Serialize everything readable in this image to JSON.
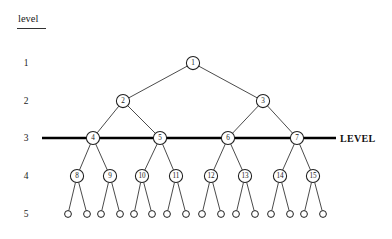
{
  "figure": {
    "header_label": "level",
    "level_line_label": "LEVEL",
    "level_numbers": [
      "1",
      "2",
      "3",
      "4",
      "5"
    ],
    "highlighted_level": "3"
  },
  "colors": {
    "background": "#ffffff",
    "edge": "#2b2b2b",
    "node_stroke": "#1f1f1f",
    "node_fill": "#ffffff",
    "thick_line": "#000000",
    "text": "#1a1a1a"
  },
  "chart_data": {
    "type": "diagram",
    "levels": [
      {
        "level": "1",
        "y": 63,
        "nodes": [
          {
            "label": "1",
            "x": 193
          }
        ]
      },
      {
        "level": "2",
        "y": 101,
        "nodes": [
          {
            "label": "2",
            "x": 123
          },
          {
            "label": "3",
            "x": 263
          }
        ]
      },
      {
        "level": "3",
        "y": 138,
        "nodes": [
          {
            "label": "4",
            "x": 93
          },
          {
            "label": "5",
            "x": 160
          },
          {
            "label": "6",
            "x": 228
          },
          {
            "label": "7",
            "x": 297
          }
        ]
      },
      {
        "level": "4",
        "y": 176,
        "nodes": [
          {
            "label": "8",
            "x": 77
          },
          {
            "label": "9",
            "x": 110
          },
          {
            "label": "10",
            "x": 142
          },
          {
            "label": "11",
            "x": 176
          },
          {
            "label": "12",
            "x": 211
          },
          {
            "label": "13",
            "x": 245
          },
          {
            "label": "14",
            "x": 280
          },
          {
            "label": "15",
            "x": 313
          }
        ]
      },
      {
        "level": "5",
        "y": 214,
        "nodes": [
          {
            "label": "",
            "x": 68
          },
          {
            "label": "",
            "x": 87
          },
          {
            "label": "",
            "x": 101
          },
          {
            "label": "",
            "x": 120
          },
          {
            "label": "",
            "x": 134
          },
          {
            "label": "",
            "x": 152
          },
          {
            "label": "",
            "x": 167
          },
          {
            "label": "",
            "x": 186
          },
          {
            "label": "",
            "x": 202
          },
          {
            "label": "",
            "x": 221
          },
          {
            "label": "",
            "x": 236
          },
          {
            "label": "",
            "x": 255
          },
          {
            "label": "",
            "x": 271
          },
          {
            "label": "",
            "x": 290
          },
          {
            "label": "",
            "x": 304
          },
          {
            "label": "",
            "x": 323
          }
        ]
      }
    ],
    "edges": [
      {
        "from": "1",
        "to": "2"
      },
      {
        "from": "1",
        "to": "3"
      },
      {
        "from": "2",
        "to": "4"
      },
      {
        "from": "2",
        "to": "5"
      },
      {
        "from": "3",
        "to": "6"
      },
      {
        "from": "3",
        "to": "7"
      },
      {
        "from": "4",
        "to": "8"
      },
      {
        "from": "4",
        "to": "9"
      },
      {
        "from": "5",
        "to": "10"
      },
      {
        "from": "5",
        "to": "11"
      },
      {
        "from": "6",
        "to": "12"
      },
      {
        "from": "6",
        "to": "13"
      },
      {
        "from": "7",
        "to": "14"
      },
      {
        "from": "7",
        "to": "15"
      }
    ],
    "level_line": {
      "y": 138,
      "x_start": 42,
      "x_end": 336,
      "label": "LEVEL"
    },
    "node_radius": 6.6,
    "leaf_radius": 3.4
  }
}
